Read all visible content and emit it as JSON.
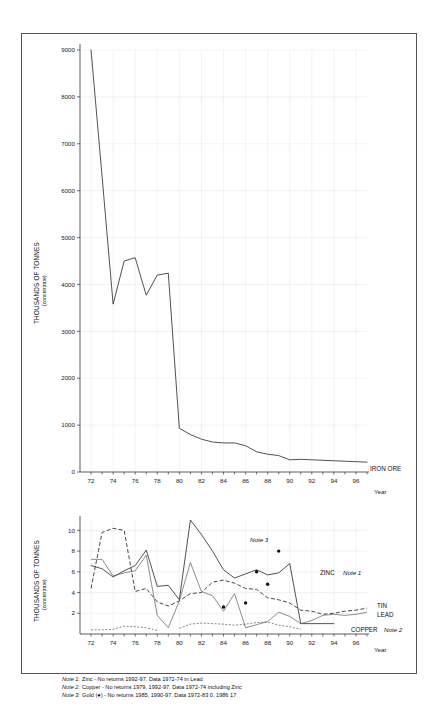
{
  "figure": {
    "background": "#ffffff",
    "frame_color": "#555555"
  },
  "upper_chart": {
    "y_axis_title": "THOUSANDS OF TONNES",
    "y_axis_subtitle": "(concentrate)",
    "x_axis_title": "Year",
    "series_label": "IRON ORE",
    "y_ticks": [
      "0",
      "1000",
      "2000",
      "3000",
      "4000",
      "5000",
      "6000",
      "7000",
      "8000",
      "9000"
    ],
    "x_ticks": [
      "72",
      "74",
      "76",
      "78",
      "80",
      "82",
      "84",
      "86",
      "88",
      "90",
      "92",
      "94",
      "96"
    ]
  },
  "lower_chart": {
    "y_axis_title": "THOUSANDS OF TONNES",
    "y_axis_subtitle": "(concentrate)",
    "x_axis_title": "Year",
    "y_ticks": [
      "2",
      "4",
      "6",
      "8",
      "10"
    ],
    "x_ticks": [
      "72",
      "74",
      "76",
      "78",
      "80",
      "82",
      "84",
      "86",
      "88",
      "90",
      "92",
      "94",
      "96"
    ],
    "labels": {
      "zinc": "ZINC",
      "zinc_note": "Note 1",
      "tin": "TIN",
      "lead": "LEAD",
      "copper": "COPPER",
      "copper_note": "Note 2",
      "gold_note": "Note 3"
    }
  },
  "notes": [
    {
      "label": "Note 1:",
      "text": "Zinc - No returns 1992-97. Data 1972-74 in Lead"
    },
    {
      "label": "Note 2:",
      "text": "Copper - No returns 1979, 1992-97. Data 1972-74  including Zinc"
    },
    {
      "label": "Note 3:",
      "text": "Gold (●) - No returns 1985, 1990-97. Data 1972-83 0, 1986 17"
    }
  ],
  "chart_data": [
    {
      "type": "line",
      "title": "Iron Ore production",
      "xlabel": "Year",
      "ylabel": "THOUSANDS OF TONNES (concentrate)",
      "xlim": [
        1971,
        1997
      ],
      "ylim": [
        0,
        9000
      ],
      "grid": true,
      "legend_position": "right-end",
      "x": [
        1972,
        1973,
        1974,
        1975,
        1976,
        1977,
        1978,
        1979,
        1980,
        1981,
        1982,
        1983,
        1984,
        1985,
        1986,
        1987,
        1988,
        1989,
        1990,
        1991,
        1992,
        1993,
        1994,
        1995,
        1996,
        1997
      ],
      "series": [
        {
          "name": "IRON ORE",
          "style": "solid",
          "values": [
            9000,
            6300,
            3580,
            4500,
            4570,
            3770,
            4200,
            4240,
            930,
            800,
            700,
            640,
            620,
            620,
            560,
            430,
            380,
            350,
            260,
            270,
            260,
            250,
            240,
            230,
            220,
            210
          ]
        }
      ]
    },
    {
      "type": "line",
      "title": "Zinc, Tin, Lead, Copper and Gold production",
      "xlabel": "Year",
      "ylabel": "THOUSANDS OF TONNES (concentrate)",
      "xlim": [
        1971,
        1997
      ],
      "ylim": [
        0,
        11
      ],
      "grid": true,
      "legend_position": "right-end",
      "x": [
        1972,
        1973,
        1974,
        1975,
        1976,
        1977,
        1978,
        1979,
        1980,
        1981,
        1982,
        1983,
        1984,
        1985,
        1986,
        1987,
        1988,
        1989,
        1990,
        1991,
        1992,
        1993,
        1994,
        1995,
        1996,
        1997
      ],
      "series": [
        {
          "name": "ZINC",
          "style": "solid",
          "note": "Note 1",
          "values": [
            6.6,
            6.3,
            5.5,
            6.1,
            6.6,
            8.1,
            4.6,
            4.7,
            3.3,
            11.0,
            9.6,
            8.0,
            6.2,
            5.4,
            5.8,
            6.2,
            5.7,
            5.9,
            6.8,
            1.0,
            1.0,
            1.0,
            1.0,
            null,
            null,
            null
          ]
        },
        {
          "name": "TIN",
          "style": "long-dash",
          "values": [
            4.4,
            9.8,
            10.2,
            10.0,
            4.1,
            4.4,
            3.1,
            2.7,
            3.2,
            3.9,
            4.0,
            5.0,
            5.2,
            4.9,
            4.4,
            4.3,
            3.5,
            3.3,
            3.0,
            2.3,
            2.2,
            1.9,
            2.0,
            2.2,
            2.3,
            2.5
          ]
        },
        {
          "name": "LEAD",
          "style": "thin-solid",
          "values": [
            7.2,
            7.2,
            5.6,
            5.9,
            6.1,
            7.6,
            1.8,
            0.6,
            3.2,
            6.9,
            4.1,
            3.7,
            2.2,
            3.9,
            0.6,
            0.9,
            1.2,
            2.1,
            1.7,
            1.0,
            1.3,
            1.8,
            1.9,
            1.8,
            1.9,
            2.1
          ]
        },
        {
          "name": "COPPER",
          "style": "short-dash",
          "note": "Note 2",
          "values": [
            0.4,
            0.4,
            0.45,
            0.75,
            0.7,
            0.6,
            0.35,
            null,
            0.55,
            0.95,
            1.05,
            1.0,
            0.95,
            0.85,
            0.95,
            1.1,
            1.15,
            0.85,
            0.7,
            0.45,
            null,
            null,
            null,
            null,
            null,
            null
          ]
        },
        {
          "name": "GOLD",
          "style": "dots",
          "note": "Note 3",
          "values": [
            null,
            null,
            null,
            null,
            null,
            null,
            null,
            null,
            null,
            null,
            null,
            null,
            2.6,
            null,
            3.0,
            6.0,
            4.8,
            8.0,
            null,
            null,
            null,
            null,
            null,
            null,
            null,
            null
          ]
        }
      ]
    }
  ]
}
